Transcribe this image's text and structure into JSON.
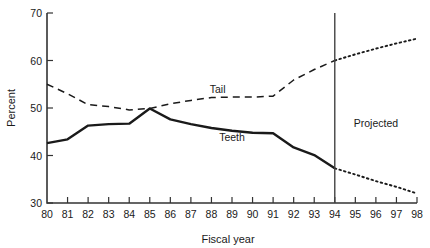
{
  "chart_data": {
    "type": "line",
    "title": "",
    "xlabel": "Fiscal year",
    "ylabel": "Percent",
    "xlim": [
      80,
      98
    ],
    "ylim": [
      30,
      70
    ],
    "grid": false,
    "legend_position": "inline-labels",
    "x_ticks": [
      "80",
      "81",
      "82",
      "83",
      "84",
      "85",
      "86",
      "87",
      "88",
      "89",
      "90",
      "91",
      "92",
      "93",
      "94",
      "95",
      "96",
      "97",
      "98"
    ],
    "y_ticks": [
      "30",
      "40",
      "50",
      "60",
      "70"
    ],
    "annotations": [
      {
        "text": "Projected",
        "x": 96,
        "y": 46
      },
      {
        "text": "Tail",
        "x": 88.3,
        "y": 53.2
      },
      {
        "text": "Teeth",
        "x": 89.0,
        "y": 43.0
      }
    ],
    "divider": {
      "label": "",
      "x": 94,
      "from_y": 30,
      "to_y": 70
    },
    "series": [
      {
        "name": "Tail",
        "style": "dashed",
        "color": "#1a1a1a",
        "x": [
          80,
          81,
          82,
          83,
          84,
          85,
          86,
          87,
          88,
          89,
          90,
          91,
          92,
          93,
          94
        ],
        "values": [
          55.0,
          53.0,
          50.7,
          50.3,
          49.6,
          49.9,
          50.9,
          51.6,
          52.2,
          52.3,
          52.3,
          52.5,
          55.9,
          58.1,
          60.0
        ]
      },
      {
        "name": "Tail projected",
        "style": "dotted",
        "color": "#1a1a1a",
        "x": [
          94,
          95,
          96,
          97,
          98
        ],
        "values": [
          60.0,
          61.3,
          62.5,
          63.6,
          64.6
        ]
      },
      {
        "name": "Teeth",
        "style": "solid",
        "color": "#1a1a1a",
        "x": [
          80,
          81,
          82,
          83,
          84,
          85,
          86,
          87,
          88,
          89,
          90,
          91,
          92,
          93,
          94
        ],
        "values": [
          42.6,
          43.4,
          46.3,
          46.6,
          46.7,
          49.9,
          47.6,
          46.6,
          45.8,
          45.2,
          44.8,
          44.7,
          41.7,
          40.1,
          37.3
        ]
      },
      {
        "name": "Teeth projected",
        "style": "dotted",
        "color": "#1a1a1a",
        "x": [
          94,
          95,
          96,
          97,
          98
        ],
        "values": [
          37.3,
          36.0,
          34.6,
          33.4,
          32.0
        ]
      }
    ]
  }
}
